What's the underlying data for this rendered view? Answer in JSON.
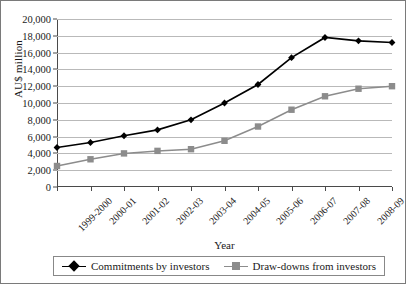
{
  "chart_data": {
    "type": "line",
    "title": "",
    "xlabel": "Year",
    "ylabel": "AU$ million",
    "categories": [
      "1999-2000",
      "2000-01",
      "2001-02",
      "2002-03",
      "2003-04",
      "2004-05",
      "2005-06",
      "2006-07",
      "2007-08",
      "2008-09",
      "2009-10"
    ],
    "ylim": [
      0,
      20000
    ],
    "yticks": [
      "0",
      "2,000",
      "4,000",
      "6,000",
      "8,000",
      "10,000",
      "12,000",
      "14,000",
      "16,000",
      "18,000",
      "20,000"
    ],
    "ytick_values": [
      0,
      2000,
      4000,
      6000,
      8000,
      10000,
      12000,
      14000,
      16000,
      18000,
      20000
    ],
    "grid": "horizontal",
    "legend_position": "bottom",
    "series": [
      {
        "name": "Commitments by investors",
        "color": "#000000",
        "marker": "diamond",
        "values": [
          4700,
          5300,
          6100,
          6800,
          8000,
          10000,
          12200,
          15400,
          17800,
          17400,
          17200
        ]
      },
      {
        "name": "Draw-downs from investors",
        "color": "#8c8c8c",
        "marker": "square",
        "values": [
          2500,
          3300,
          4000,
          4300,
          4500,
          5500,
          7200,
          9200,
          10800,
          11700,
          12000
        ]
      }
    ]
  }
}
